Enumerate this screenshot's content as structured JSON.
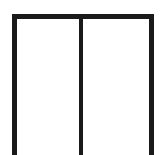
{
  "diagram": {
    "type": "outline",
    "panels": 2,
    "stroke_color": "#1a1a1a",
    "background_color": "#ffffff"
  }
}
